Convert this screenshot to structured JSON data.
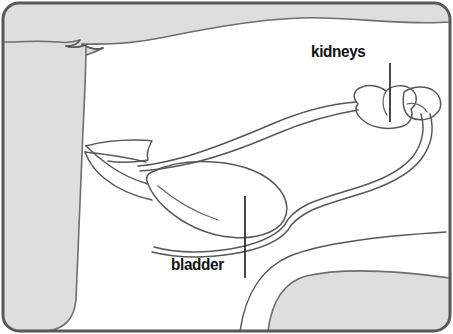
{
  "figure": {
    "background_color": "#ffffff",
    "body_fill_color": "#dedede",
    "outline_color": "#58585a",
    "label_color": "#111111",
    "frame_color": "#58585a"
  },
  "labels": [
    {
      "id": "kidneys",
      "text": "kidneys",
      "x": 311,
      "y": 42,
      "leader": {
        "x1": 390,
        "y1": 63,
        "x2": 390,
        "y2": 122
      }
    },
    {
      "id": "bladder",
      "text": "bladder",
      "x": 171,
      "y": 255,
      "leader": {
        "x1": 245,
        "y1": 196,
        "x2": 245,
        "y2": 278
      }
    }
  ],
  "organs": [
    {
      "name": "kidney-left",
      "type": "bean-shape"
    },
    {
      "name": "kidney-right",
      "type": "bean-shape"
    },
    {
      "name": "ureter-upper",
      "type": "tube"
    },
    {
      "name": "ureter-lower",
      "type": "tube"
    },
    {
      "name": "bladder",
      "type": "teardrop"
    },
    {
      "name": "urethra",
      "type": "tube"
    }
  ],
  "body_regions": [
    {
      "name": "back-torso-band",
      "position": "top"
    },
    {
      "name": "foreleg-shoulder",
      "position": "left"
    },
    {
      "name": "hindquarter-thigh",
      "position": "bottom-right"
    }
  ]
}
